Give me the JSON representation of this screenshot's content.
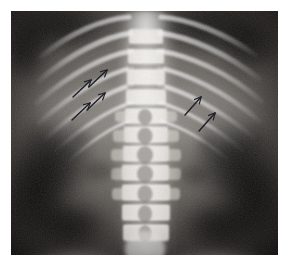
{
  "image": {
    "modality": "x-ray-radiograph",
    "view": "anteroposterior",
    "body_region": "thoracolumbar-spine-abdomen",
    "alt_text": "Anteroposterior abdominal radiograph showing the thoracolumbar spine, rib cage and iliac crests with six annotation arrows",
    "canvas": {
      "width": 290,
      "height": 268,
      "background": "#ffffff"
    },
    "film": {
      "x": 11,
      "y": 11,
      "width": 267,
      "height": 244
    }
  },
  "palette": {
    "page_background": "#ffffff",
    "film_darkest": "#0a0a0a",
    "soft_tissue_dark": "#231f1f",
    "soft_tissue_mid": "#6e6a66",
    "bone_mid": "#b8b4ae",
    "bone_bright": "#e8e6e1",
    "bone_brightest": "#f7f6f3",
    "arrow_color": "#14161c"
  },
  "anatomy": {
    "structures": [
      {
        "name": "spine-column",
        "label": "Vertebral column",
        "region": "center"
      },
      {
        "name": "vertebral-body",
        "label": "Vertebral bodies",
        "region": "center"
      },
      {
        "name": "spinous-process",
        "label": "Spinous processes",
        "region": "center"
      },
      {
        "name": "rib-cage-left",
        "label": "Left rib cage",
        "region": "upper-left"
      },
      {
        "name": "rib-cage-right",
        "label": "Right rib cage",
        "region": "upper-right"
      },
      {
        "name": "iliac-crest-left",
        "label": "Left iliac crest",
        "region": "bottom-left"
      },
      {
        "name": "iliac-crest-right",
        "label": "Right iliac crest",
        "region": "bottom-right"
      },
      {
        "name": "flank-soft-tissue",
        "label": "Flank soft tissue",
        "region": "mid-lateral"
      }
    ],
    "vertebrae": {
      "count": 11,
      "bodies_y": [
        26,
        46,
        66,
        86,
        104,
        122,
        141,
        160,
        180,
        200,
        220
      ]
    },
    "ribs": {
      "left_count": 7,
      "right_count": 7
    }
  },
  "annotations": {
    "count": 6,
    "style": {
      "color": "#14161c",
      "direction": "up-right",
      "shape": "open-arrow"
    },
    "arrows": [
      {
        "id": "arrow-left-1",
        "group": "left",
        "tail_x": 78,
        "tail_y": 76,
        "head_x": 96,
        "head_y": 59
      },
      {
        "id": "arrow-left-2",
        "group": "left",
        "tail_x": 62,
        "tail_y": 86,
        "head_x": 80,
        "head_y": 69
      },
      {
        "id": "arrow-left-3",
        "group": "left",
        "tail_x": 76,
        "tail_y": 99,
        "head_x": 94,
        "head_y": 82
      },
      {
        "id": "arrow-left-4",
        "group": "left",
        "tail_x": 61,
        "tail_y": 109,
        "head_x": 79,
        "head_y": 92
      },
      {
        "id": "arrow-right-1",
        "group": "right",
        "tail_x": 174,
        "tail_y": 104,
        "head_x": 190,
        "head_y": 86
      },
      {
        "id": "arrow-right-2",
        "group": "right",
        "tail_x": 188,
        "tail_y": 120,
        "head_x": 204,
        "head_y": 102
      }
    ]
  }
}
